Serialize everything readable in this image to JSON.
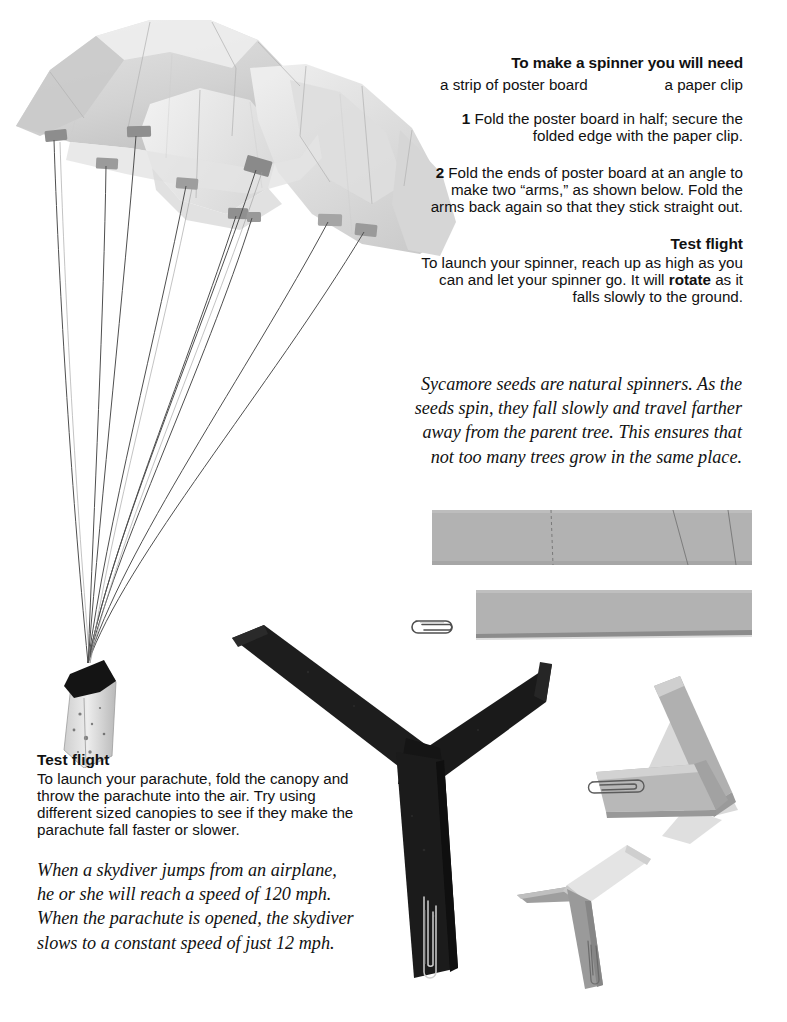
{
  "page": {
    "background_color": "#ffffff",
    "text_color": "#1a1a1a"
  },
  "spinner_instructions": {
    "heading": "To make a spinner you will need",
    "materials": [
      "a strip of poster board",
      "a paper clip"
    ],
    "steps": [
      {
        "number": "1",
        "text": "Fold the poster board in half; secure the folded edge with the paper clip."
      },
      {
        "number": "2",
        "text": "Fold the ends of poster board at an angle to make two “arms,” as shown below. Fold the arms back again so that they stick straight out."
      }
    ],
    "test_flight": {
      "heading": "Test flight",
      "text_before_bold": "To launch your spinner, reach up as high as you can and let your spinner go. It will ",
      "bold_word": "rotate",
      "text_after_bold": " as it falls slowly to the ground."
    }
  },
  "sycamore_note": {
    "text": "Sycamore seeds are natural spinners. As the seeds spin, they fall slowly and travel farther away from the parent tree. This ensures that not too many trees grow in the same place."
  },
  "parachute_instructions": {
    "test_flight": {
      "heading": "Test flight",
      "text": "To launch your parachute, fold the canopy and throw the parachute into the air. Try using different sized canopies to see if they make the parachute fall faster or slower."
    }
  },
  "skydiver_note": {
    "text": "When a skydiver jumps from an airplane, he or she will reach a speed of 120 mph. When the parachute is opened, the skydiver slows to a constant speed of just 12 mph."
  },
  "illustrations": {
    "parachute": {
      "name": "parachute-photo",
      "canopy_color": "#dcdcdc",
      "canopy_shade_color": "#c2c2c2",
      "tape_tab_color": "#8f8f8f",
      "string_color": "#4a4a4a",
      "payload_color": "#d8d8d8",
      "payload_cap_color": "#141414",
      "string_count": "8"
    },
    "poster_board_strip": {
      "name": "poster-board-strip-photo",
      "color": "#b2b2b2",
      "fold_line_color": "#6e6e6e",
      "fold_lines": "3"
    },
    "folded_strip": {
      "name": "folded-poster-board-photo",
      "color": "#b2b2b2"
    },
    "paper_clip": {
      "name": "paper-clip-photo",
      "color": "#5a5a5a"
    },
    "black_spinner": {
      "name": "black-spinner-photo",
      "color": "#1c1c1c",
      "clip_color": "#c8c8c8",
      "arms": "3"
    },
    "gray_folded_spinner": {
      "name": "gray-folded-spinner-photo",
      "color": "#a8a8a8",
      "shadow_color": "#d4d4d4"
    },
    "gray_finished_spinner": {
      "name": "gray-finished-spinner-photo",
      "color": "#a8a8a8",
      "light_face_color": "#e2e2e2"
    }
  }
}
